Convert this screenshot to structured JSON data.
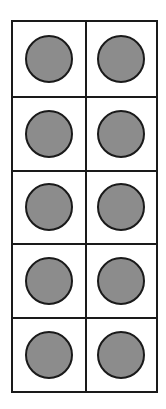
{
  "figure": {
    "type": "ten-frame",
    "rows": 5,
    "columns": 2,
    "filled_count": 10,
    "counter_color": "#8c8c8c",
    "border_color": "#1a1a1a",
    "cells": [
      {
        "row": 1,
        "col": 1,
        "filled": true
      },
      {
        "row": 1,
        "col": 2,
        "filled": true
      },
      {
        "row": 2,
        "col": 1,
        "filled": true
      },
      {
        "row": 2,
        "col": 2,
        "filled": true
      },
      {
        "row": 3,
        "col": 1,
        "filled": true
      },
      {
        "row": 3,
        "col": 2,
        "filled": true
      },
      {
        "row": 4,
        "col": 1,
        "filled": true
      },
      {
        "row": 4,
        "col": 2,
        "filled": true
      },
      {
        "row": 5,
        "col": 1,
        "filled": true
      },
      {
        "row": 5,
        "col": 2,
        "filled": true
      }
    ]
  }
}
